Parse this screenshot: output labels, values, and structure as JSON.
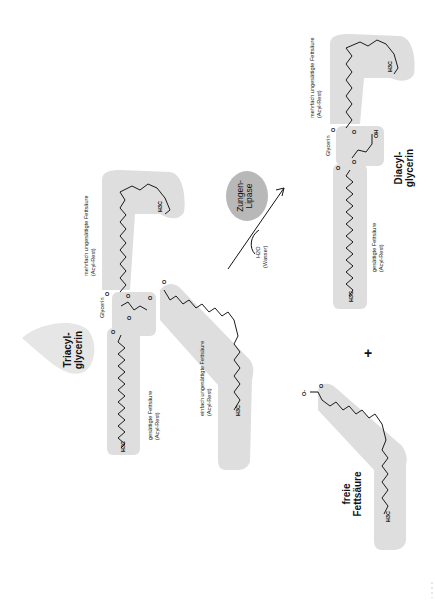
{
  "diagram": {
    "title_reactant": "Triacyl-\nglycerin",
    "reactant": {
      "name_line1": "Triacyl-",
      "name_line2": "glycerin",
      "glycerin_label": "Glycerin",
      "chains": [
        {
          "id": "saturated",
          "label_line1": "gesättigte Fettsäure",
          "label_line2": "(Acyl-Rest)",
          "terminal": "H3C"
        },
        {
          "id": "polyunsaturated",
          "label_line1": "mehrfach ungesättigte Fettsäure",
          "label_line2": "(Acyl-Rest)",
          "terminal": "H3C"
        },
        {
          "id": "monounsaturated",
          "label_line1": "einfach ungesättigte Fettsäure",
          "label_line2": "(Acyl-Rest)",
          "terminal": "H3C"
        }
      ]
    },
    "enzyme": {
      "line1": "Zungen-",
      "line2": "Lipase"
    },
    "cosubstrate": {
      "formula": "H2O",
      "name": "(Wasser)"
    },
    "product_main": {
      "name_line1": "Diacyl-",
      "name_line2": "glycerin",
      "glycerin_label": "Glycerin",
      "hydroxyl": "OH",
      "chains": [
        {
          "id": "polyunsaturated",
          "label_line1": "mehrfach ungesättigte Fettsäure",
          "label_line2": "(Acyl-Rest)",
          "terminal": "H3C"
        },
        {
          "id": "saturated",
          "label_line1": "gesättigte Fettsäure",
          "label_line2": "(Acyl-Rest)",
          "terminal": "H3C"
        }
      ]
    },
    "plus_sign": "+",
    "product_free": {
      "name_line1": "freie",
      "name_line2": "Fettsäure",
      "carboxylate": "O-",
      "terminal": "H3C"
    },
    "atoms": {
      "oxygen": "O",
      "h3c": "H",
      "sub3": "3",
      "c": "C",
      "h2o_h": "H",
      "sub2": "2",
      "h2o_o": "O"
    },
    "colors": {
      "shade": "#dedede",
      "bond": "#1a1a1a",
      "enzyme_fill": "#b8b8b8",
      "text": "#111111"
    }
  }
}
